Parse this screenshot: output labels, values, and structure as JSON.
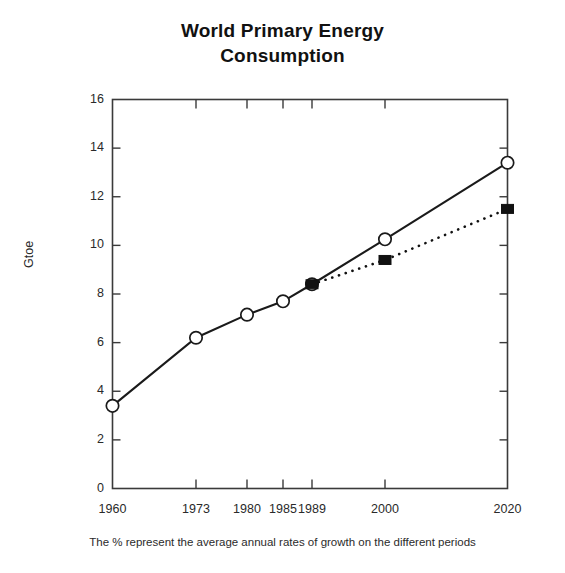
{
  "chart_data": {
    "type": "line",
    "title": "World Primary Energy\nConsumption",
    "xlabel": "",
    "ylabel": "Gtoe",
    "caption": "The % represent the average annual rates of growth on the different periods",
    "grid": false,
    "legend": "none",
    "xlim": [
      1960,
      2020
    ],
    "ylim": [
      0,
      16
    ],
    "ytick_step": 2,
    "yticks": [
      0,
      2,
      4,
      6,
      8,
      10,
      12,
      14,
      16
    ],
    "ytick_labels": [
      "0",
      "2",
      "4",
      "6",
      "8",
      "10",
      "12",
      "14",
      "16"
    ],
    "xticks": [
      1960,
      1973,
      1980,
      1985,
      1989,
      2000,
      2020
    ],
    "xtick_labels": [
      "1960",
      "1973",
      "1980",
      "1985",
      "1989",
      "2000",
      "2020"
    ],
    "series": [
      {
        "name": "high-scenario",
        "marker": "open-circle",
        "line_style": "solid",
        "color": "#1a1a1a",
        "x": [
          1960,
          1973,
          1980,
          1985,
          1989,
          2000,
          2020
        ],
        "values": [
          3.4,
          6.2,
          7.15,
          7.7,
          8.4,
          10.25,
          13.4
        ]
      },
      {
        "name": "low-scenario",
        "marker": "filled-square",
        "line_style": "dotted",
        "color": "#111111",
        "x": [
          1989,
          2000,
          2020
        ],
        "values": [
          8.4,
          9.4,
          11.5
        ]
      }
    ]
  },
  "figure": {
    "frame_color": "#3a3a3a",
    "background": "#ffffff"
  }
}
